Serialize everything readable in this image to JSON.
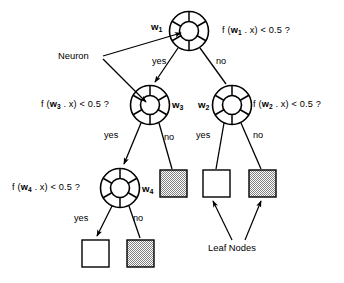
{
  "figure": {
    "background": "#ffffff",
    "stroke": "#000000",
    "leaf_shaded_fill": "#b8b8b8"
  },
  "conditions": {
    "root": {
      "prefix": "f (",
      "weight": "w",
      "sub": "1",
      "middle": " . x)  <  0.5 ?"
    },
    "left": {
      "prefix": "f (",
      "weight": "w",
      "sub": "3",
      "middle": " . x)  <  0.5 ?"
    },
    "right": {
      "prefix": "f (",
      "weight": "w",
      "sub": "2",
      "middle": " . x)  <  0.5 ?"
    },
    "leftleft": {
      "prefix": "f (",
      "weight": "w",
      "sub": "4",
      "middle": " . x)  <  0.5 ?"
    }
  },
  "weight_labels": {
    "w1": {
      "text": "w",
      "sub": "1"
    },
    "w2": {
      "text": "w",
      "sub": "2"
    },
    "w3": {
      "text": "w",
      "sub": "3"
    },
    "w4": {
      "text": "w",
      "sub": "4"
    }
  },
  "branches": {
    "root_yes": "yes",
    "root_no": "no",
    "left_yes": "yes",
    "left_no": "no",
    "right_yes": "yes",
    "right_no": "no",
    "leftleft_yes": "yes",
    "leftleft_no": "no"
  },
  "annotations": {
    "neuron": "Neuron",
    "leaf_nodes": "Leaf Nodes"
  },
  "nodes": [
    {
      "id": "n1",
      "name": "neuron-node-w1",
      "cx": 189,
      "cy": 31,
      "r_outer": 20,
      "r_inner": 10
    },
    {
      "id": "n2",
      "name": "neuron-node-w3",
      "cx": 150,
      "cy": 105,
      "r_outer": 20,
      "r_inner": 10
    },
    {
      "id": "n3",
      "name": "neuron-node-w2",
      "cx": 232,
      "cy": 105,
      "r_outer": 20,
      "r_inner": 10
    },
    {
      "id": "n4",
      "name": "neuron-node-w4",
      "cx": 120,
      "cy": 188,
      "r_outer": 20,
      "r_inner": 10
    }
  ],
  "leaves": [
    {
      "id": "l1",
      "name": "leaf-node-shaded-left",
      "x": 160,
      "y": 170,
      "w": 27,
      "h": 27,
      "shaded": true
    },
    {
      "id": "l2",
      "name": "leaf-node-white-right",
      "x": 203,
      "y": 170,
      "w": 27,
      "h": 27,
      "shaded": false
    },
    {
      "id": "l3",
      "name": "leaf-node-shaded-right",
      "x": 249,
      "y": 170,
      "w": 27,
      "h": 27,
      "shaded": true
    },
    {
      "id": "l4",
      "name": "leaf-node-white-bottom",
      "x": 82,
      "y": 240,
      "w": 27,
      "h": 27,
      "shaded": false
    },
    {
      "id": "l5",
      "name": "leaf-node-shaded-bottom",
      "x": 127,
      "y": 240,
      "w": 27,
      "h": 27,
      "shaded": true
    }
  ]
}
